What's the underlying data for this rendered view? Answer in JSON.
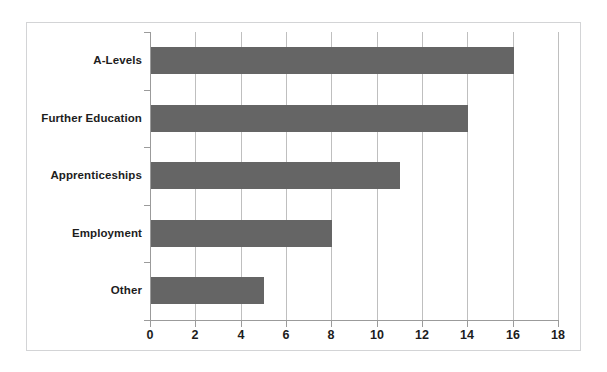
{
  "chart_data": {
    "type": "bar",
    "orientation": "horizontal",
    "title": "",
    "subtitle": "",
    "xlabel": "",
    "ylabel": "",
    "categories": [
      "A-Levels",
      "Further Education",
      "Apprenticeships",
      "Employment",
      "Other"
    ],
    "values": [
      16,
      14,
      11,
      8,
      5
    ],
    "series": [
      {
        "name": "",
        "values": [
          16,
          14,
          11,
          8,
          5
        ]
      }
    ],
    "xlim": [
      0,
      18
    ],
    "xticks": [
      0,
      2,
      4,
      6,
      8,
      10,
      12,
      14,
      16,
      18
    ],
    "xtick_labels": [
      "0",
      "2",
      "4",
      "6",
      "8",
      "10",
      "12",
      "14",
      "16",
      "18"
    ],
    "grid": "vertical-only",
    "legend": "none",
    "annotations": [],
    "colors": {
      "bar": "#656565",
      "gridline": "#bfbfbf",
      "axis": "#9b9b9b",
      "frame": "#d3d4d6",
      "text": "#1d1d1d",
      "background": "#ffffff"
    }
  }
}
